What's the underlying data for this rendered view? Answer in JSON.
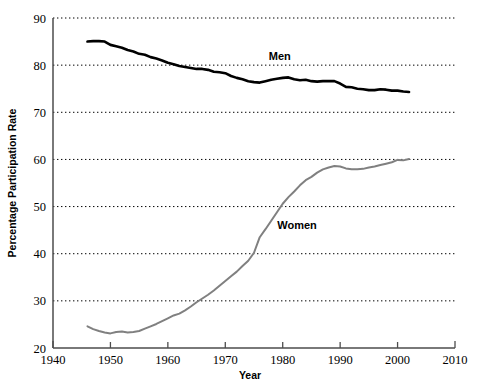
{
  "chart_data": {
    "type": "line",
    "title": "",
    "xlabel": "Year",
    "ylabel": "Percentage Participation Rate",
    "xlim": [
      1940,
      2010
    ],
    "ylim": [
      20,
      90
    ],
    "xticks": [
      1940,
      1950,
      1960,
      1970,
      1980,
      1990,
      2000,
      2010
    ],
    "xtick_labels": [
      "1940",
      "1950",
      "1960",
      "1970",
      "1980",
      "1990",
      "2000",
      "2010"
    ],
    "yticks": [
      20,
      30,
      40,
      50,
      60,
      70,
      80,
      90
    ],
    "ytick_labels": [
      "20",
      "30",
      "40",
      "50",
      "60",
      "70",
      "80",
      "90"
    ],
    "grid": "horizontal-dotted",
    "legend_position": "inline-annotations",
    "series": [
      {
        "name": "Men",
        "label": "Men",
        "color": "#000000",
        "line_width": 2.6,
        "label_x": 1979.5,
        "label_y": 81.0,
        "x": [
          1946,
          1947,
          1948,
          1949,
          1950,
          1951,
          1952,
          1953,
          1954,
          1955,
          1956,
          1957,
          1958,
          1959,
          1960,
          1961,
          1962,
          1963,
          1964,
          1965,
          1966,
          1967,
          1968,
          1969,
          1970,
          1971,
          1972,
          1973,
          1974,
          1975,
          1976,
          1977,
          1978,
          1979,
          1980,
          1981,
          1982,
          1983,
          1984,
          1985,
          1986,
          1987,
          1988,
          1989,
          1990,
          1991,
          1992,
          1993,
          1994,
          1995,
          1996,
          1997,
          1998,
          1999,
          2000,
          2001,
          2002
        ],
        "values": [
          85.0,
          85.1,
          85.1,
          85.0,
          84.3,
          84.0,
          83.7,
          83.2,
          82.9,
          82.4,
          82.2,
          81.7,
          81.4,
          81.0,
          80.5,
          80.2,
          79.8,
          79.6,
          79.4,
          79.2,
          79.2,
          79.0,
          78.6,
          78.5,
          78.3,
          77.7,
          77.3,
          77.0,
          76.6,
          76.4,
          76.3,
          76.6,
          76.9,
          77.1,
          77.3,
          77.4,
          77.0,
          76.8,
          76.9,
          76.6,
          76.5,
          76.6,
          76.6,
          76.6,
          76.1,
          75.4,
          75.3,
          75.0,
          74.9,
          74.7,
          74.7,
          74.9,
          74.8,
          74.6,
          74.6,
          74.4,
          74.3
        ]
      },
      {
        "name": "Women",
        "label": "Women",
        "color": "#808080",
        "line_width": 2.0,
        "label_x": 1982.5,
        "label_y": 45.3,
        "x": [
          1946,
          1947,
          1948,
          1949,
          1950,
          1951,
          1952,
          1953,
          1954,
          1955,
          1956,
          1957,
          1958,
          1959,
          1960,
          1961,
          1962,
          1963,
          1964,
          1965,
          1966,
          1967,
          1968,
          1969,
          1970,
          1971,
          1972,
          1973,
          1974,
          1975,
          1976,
          1977,
          1978,
          1979,
          1980,
          1981,
          1982,
          1983,
          1984,
          1985,
          1986,
          1987,
          1988,
          1989,
          1990,
          1991,
          1992,
          1993,
          1994,
          1995,
          1996,
          1997,
          1998,
          1999,
          2000,
          2001,
          2002
        ],
        "values": [
          24.6,
          24.0,
          23.6,
          23.3,
          23.1,
          23.4,
          23.5,
          23.3,
          23.4,
          23.6,
          24.1,
          24.6,
          25.1,
          25.7,
          26.3,
          26.9,
          27.3,
          28.0,
          28.8,
          29.7,
          30.5,
          31.3,
          32.2,
          33.2,
          34.2,
          35.2,
          36.2,
          37.4,
          38.5,
          40.2,
          43.5,
          45.2,
          47.0,
          48.8,
          50.6,
          52.0,
          53.2,
          54.5,
          55.6,
          56.3,
          57.2,
          57.9,
          58.3,
          58.6,
          58.5,
          58.1,
          57.9,
          57.9,
          58.0,
          58.3,
          58.5,
          58.8,
          59.1,
          59.4,
          59.9,
          59.8,
          60.1
        ]
      }
    ]
  },
  "axis": {
    "x_title": "Year",
    "y_title": "Percentage Participation Rate"
  }
}
